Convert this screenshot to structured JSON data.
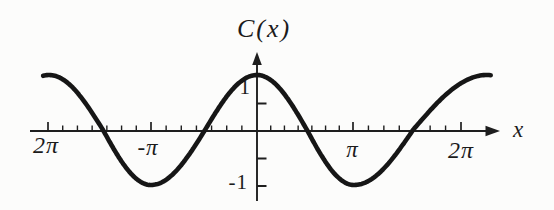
{
  "chart_data": {
    "type": "line",
    "title": "C(x)",
    "xlabel": "x",
    "ylabel": "C(x)",
    "function": "C(x) = cos x",
    "x_over_pi": [
      -2,
      -1.75,
      -1.5,
      -1.25,
      -1,
      -0.75,
      -0.5,
      -0.25,
      0,
      0.25,
      0.5,
      0.75,
      1,
      1.25,
      1.5,
      1.75,
      2
    ],
    "y": [
      1,
      0.71,
      0,
      -0.71,
      -1,
      -0.71,
      0,
      0.71,
      1,
      0.71,
      0,
      -0.71,
      -1,
      -0.71,
      0,
      0.71,
      1
    ],
    "xlim_over_pi": [
      -2.3,
      2.45
    ],
    "ylim": [
      -1.45,
      1.5
    ],
    "grid": false,
    "legend": false,
    "x_axis": {
      "label": "x",
      "arrow": "right",
      "major_ticks_over_pi": [
        -2,
        -1,
        1,
        2
      ],
      "major_tick_labels": [
        "2π",
        "-π",
        "π",
        "2π"
      ],
      "minor_divisions_per_interval": 7
    },
    "y_axis": {
      "arrow": "up",
      "ticks": [
        1,
        0.5,
        -0.5,
        -1
      ],
      "tick_labels": [
        "1",
        "-1"
      ]
    },
    "colors": {
      "curve": "#161616",
      "axis": "#1e1e1e",
      "text": "#1b1b1b",
      "background": "#fcfcfb"
    }
  }
}
